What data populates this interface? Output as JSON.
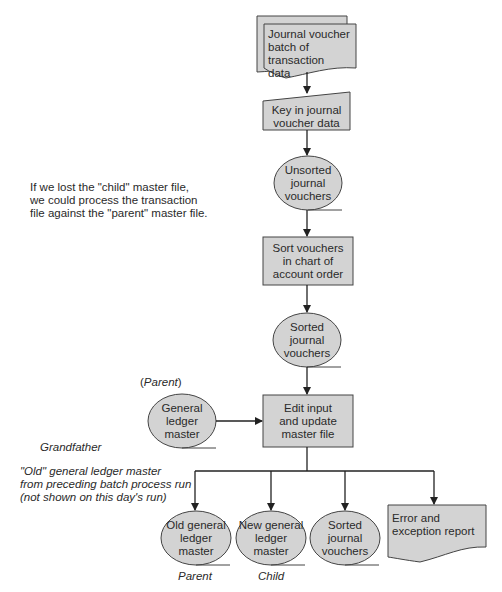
{
  "diagram": {
    "type": "flowchart",
    "colors": {
      "fill": "#d3d3d3",
      "stroke": "#444444",
      "background": "#ffffff"
    },
    "nodes": [
      {
        "id": "journal_batch",
        "shape": "document-stack",
        "label": "Journal voucher batch of transaction data"
      },
      {
        "id": "key_in",
        "shape": "manual-input",
        "label": "Key in journal voucher data"
      },
      {
        "id": "unsorted",
        "shape": "storage-oval",
        "label": "Unsorted journal vouchers"
      },
      {
        "id": "sort",
        "shape": "process",
        "label": "Sort vouchers in chart of account order"
      },
      {
        "id": "sorted",
        "shape": "storage-oval",
        "label": "Sorted journal vouchers"
      },
      {
        "id": "gl_master",
        "shape": "storage-oval",
        "label": "General ledger master"
      },
      {
        "id": "edit_update",
        "shape": "process",
        "label": "Edit input and update master file"
      },
      {
        "id": "old_gl",
        "shape": "storage-oval",
        "label": "Old general ledger master"
      },
      {
        "id": "new_gl",
        "shape": "storage-oval",
        "label": "New general ledger master"
      },
      {
        "id": "sorted_out",
        "shape": "storage-oval",
        "label": "Sorted journal vouchers"
      },
      {
        "id": "error_report",
        "shape": "document",
        "label": "Error and exception report"
      }
    ],
    "edges": [
      [
        "journal_batch",
        "key_in"
      ],
      [
        "key_in",
        "unsorted"
      ],
      [
        "unsorted",
        "sort"
      ],
      [
        "sort",
        "sorted"
      ],
      [
        "sorted",
        "edit_update"
      ],
      [
        "gl_master",
        "edit_update"
      ],
      [
        "edit_update",
        "old_gl"
      ],
      [
        "edit_update",
        "new_gl"
      ],
      [
        "edit_update",
        "sorted_out"
      ],
      [
        "edit_update",
        "error_report"
      ]
    ]
  },
  "labels": {
    "journal_batch": [
      "Journal voucher",
      "batch of transaction",
      "data"
    ],
    "key_in": [
      "Key in journal",
      "voucher data"
    ],
    "unsorted": [
      "Unsorted",
      "journal",
      "vouchers"
    ],
    "sort": [
      "Sort vouchers",
      "in chart of",
      "account order"
    ],
    "sorted": [
      "Sorted",
      "journal",
      "vouchers"
    ],
    "gl_master": [
      "General",
      "ledger",
      "master"
    ],
    "edit_update": [
      "Edit input",
      "and update",
      "master file"
    ],
    "old_gl": [
      "Old general",
      "ledger",
      "master"
    ],
    "new_gl": [
      "New general",
      "ledger",
      "master"
    ],
    "sorted_out": [
      "Sorted",
      "journal",
      "vouchers"
    ],
    "error_report": [
      "Error and",
      "exception report"
    ]
  },
  "annotations": {
    "child_note": [
      "If we lost the \"child\" master file,",
      "we could process the transaction",
      "file against the \"parent\" master file."
    ],
    "parent_tag_open": "(",
    "parent_tag_word": "Parent",
    "parent_tag_close": ")",
    "grandfather": "Grandfather",
    "old_note": [
      "\"Old\" general ledger master",
      "from preceding batch process run",
      "(not shown on this day's run)"
    ],
    "parent": "Parent",
    "child": "Child"
  }
}
